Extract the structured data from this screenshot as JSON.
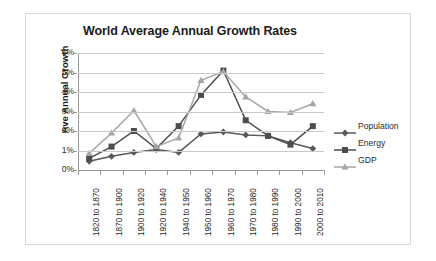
{
  "chart_data": {
    "type": "line",
    "title": "World Average Annual Growth Rates",
    "xlabel": "",
    "ylabel": "Ave Annual Growth",
    "ylim": [
      0,
      6
    ],
    "ytick_labels": [
      "0%",
      "1%",
      "2%",
      "3%",
      "4%",
      "5%",
      "6%"
    ],
    "ytick_values": [
      0,
      1,
      2,
      3,
      4,
      5,
      6
    ],
    "grid": "horizontal",
    "legend_position": "right",
    "categories": [
      "1820 to 1870",
      "1870 to 1900",
      "1900 to 1920",
      "1920 to 1940",
      "1940 to 1950",
      "1950 to 1960",
      "1960 to 1970",
      "1970 to 1980",
      "1980 to 1990",
      "1990 to 2000",
      "2000 to 2010"
    ],
    "series": [
      {
        "name": "Population",
        "marker": "diamond",
        "color": "#595959",
        "values": [
          0.45,
          0.7,
          0.9,
          1.05,
          0.9,
          1.85,
          1.95,
          1.8,
          1.75,
          1.4,
          1.1
        ]
      },
      {
        "name": "Energy",
        "marker": "square",
        "color": "#4d4d4d",
        "values": [
          0.6,
          1.2,
          2.0,
          1.1,
          2.25,
          3.85,
          5.1,
          2.55,
          1.75,
          1.3,
          2.25
        ]
      },
      {
        "name": "GDP",
        "marker": "triangle",
        "color": "#a6a6a6",
        "values": [
          0.85,
          1.9,
          3.05,
          1.2,
          1.65,
          4.6,
          5.05,
          3.75,
          3.0,
          2.95,
          3.4
        ]
      }
    ]
  },
  "legend": {
    "items": [
      {
        "label": "Population"
      },
      {
        "label": "Energy"
      },
      {
        "label": "GDP"
      }
    ]
  }
}
